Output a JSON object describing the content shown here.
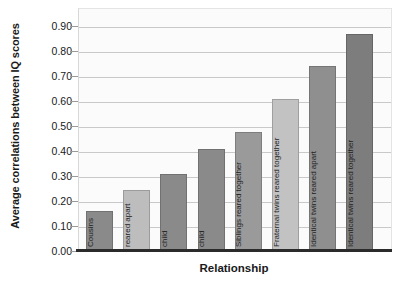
{
  "chart_data": {
    "type": "bar",
    "title": "",
    "xlabel": "Relationship",
    "ylabel": "Average correlations between IQ scores",
    "ylim": [
      0.0,
      0.95
    ],
    "ytick_labels": [
      "0.00",
      "0.10",
      "0.20",
      "0.30",
      "0.40",
      "0.50",
      "0.60",
      "0.70",
      "0.80",
      "0.90"
    ],
    "ytick_values": [
      0.0,
      0.1,
      0.2,
      0.3,
      0.4,
      0.5,
      0.6,
      0.7,
      0.8,
      0.9
    ],
    "grid": true,
    "legend": "none",
    "categories": [
      "Cousins",
      "Siblings reared apart",
      "Foster parent/child",
      "Biological parent/child",
      "Siblings reared together",
      "Fraternal twins reared together",
      "Identical twins reared apart",
      "Identical twins reared together"
    ],
    "category_lines": [
      [
        "Cousins",
        ""
      ],
      [
        "Siblings",
        "reared apart"
      ],
      [
        "Foster parent/",
        "child"
      ],
      [
        "Biological parent/",
        "child"
      ],
      [
        "Siblings reared together",
        ""
      ],
      [
        "Fraternal twins reared together",
        ""
      ],
      [
        "Identical twins reared apart",
        ""
      ],
      [
        "Identical twins reared together",
        ""
      ]
    ],
    "values": [
      0.16,
      0.245,
      0.31,
      0.41,
      0.475,
      0.61,
      0.74,
      0.87
    ],
    "bar_colors": [
      "#8a8a8a",
      "#bdbdbd",
      "#8a8a8a",
      "#8a8a8a",
      "#9a9a9a",
      "#c2c2c2",
      "#8f8f8f",
      "#7d7d7d"
    ],
    "colors": {
      "plot_background": "#fbfbfb",
      "gridline": "#c9c9c9",
      "axis": "#2b2b2b",
      "text": "#1a1a1a"
    }
  }
}
